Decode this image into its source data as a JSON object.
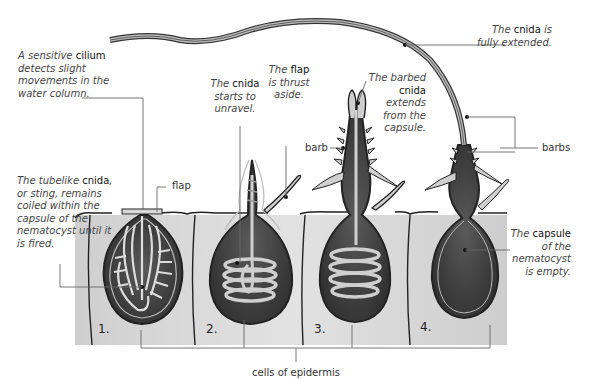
{
  "diagram": {
    "type": "biological-process",
    "stages": [
      {
        "number": "1.",
        "state": "coiled"
      },
      {
        "number": "2.",
        "state": "unraveling"
      },
      {
        "number": "3.",
        "state": "extending"
      },
      {
        "number": "4.",
        "state": "fully extended / empty capsule"
      }
    ]
  },
  "labels": {
    "cilium": {
      "pre": "A sensitive ",
      "term": "cilium",
      "post": " detects slight movements in the water column."
    },
    "flap": {
      "text": "flap"
    },
    "tubelike": {
      "pre": "The tubelike ",
      "term": "cnida",
      "post": ", or sting, remains coiled within the capsule of the nematocyst until it is fired."
    },
    "unravel": {
      "pre": "The ",
      "term": "cnida",
      "post": " starts to unravel."
    },
    "thrust": {
      "pre": "The ",
      "term": "flap",
      "post": " is thrust aside."
    },
    "barb": {
      "text": "barb"
    },
    "barbed": {
      "pre": "The barbed ",
      "term": "cnida",
      "post": " extends from the capsule."
    },
    "extended": {
      "pre": "The ",
      "term": "cnida",
      "post": " is fully extended."
    },
    "barbs": {
      "text": "barbs"
    },
    "capsule": {
      "pre": "The ",
      "term": "capsule",
      "post": " of the nematocyst is empty."
    },
    "epidermis": {
      "text": "cells of epidermis"
    }
  },
  "stage_numbers": [
    "1.",
    "2.",
    "3.",
    "4."
  ],
  "colors": {
    "capsule_dark": "#4a4a4a",
    "capsule_fill": "#3c3c3c",
    "tube_light": "#bdbdbd",
    "cell_fill": "#d9d9d9",
    "outline": "#222222",
    "leader": "#555555"
  }
}
